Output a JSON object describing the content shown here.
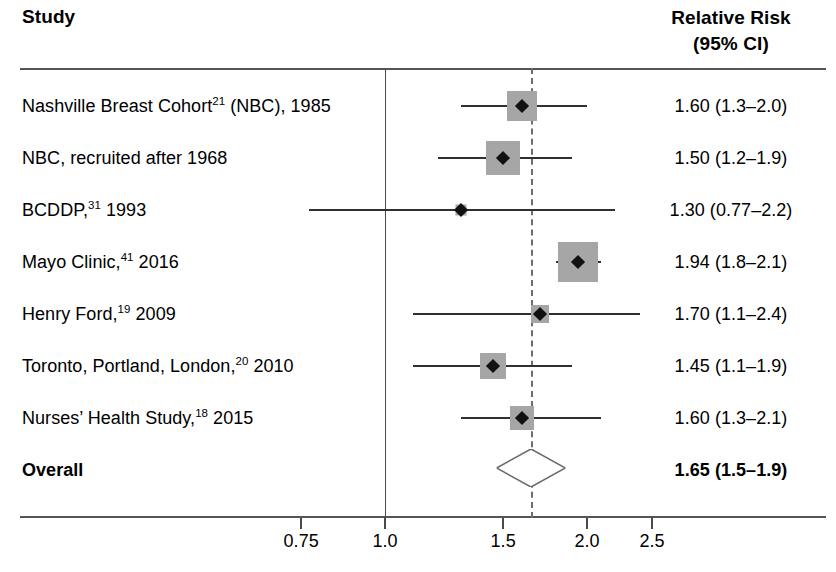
{
  "header": {
    "study_label": "Study",
    "rr_line1": "Relative Risk",
    "rr_line2": "(95% CI)"
  },
  "axis": {
    "tick_labels": [
      "0.75",
      "1.0",
      "1.5",
      "2.0",
      "2.5"
    ],
    "tick_values": [
      0.75,
      1.0,
      1.5,
      2.0,
      2.5
    ],
    "null_value": 1.0,
    "pooled_line_value": 1.65,
    "scale": "log"
  },
  "rows": [
    {
      "label_pre": "Nashville Breast Cohort",
      "ref": "21",
      "label_post": " (NBC), 1985",
      "value_text": "1.60 (1.3–2.0)",
      "rr": 1.6,
      "lo": 1.3,
      "hi": 2.0,
      "weight_box": 30,
      "bold": false
    },
    {
      "label_pre": "NBC, recruited after 1968",
      "ref": "",
      "label_post": "",
      "value_text": "1.50 (1.2–1.9)",
      "rr": 1.5,
      "lo": 1.2,
      "hi": 1.9,
      "weight_box": 34,
      "bold": false
    },
    {
      "label_pre": "BCDDP,",
      "ref": "31",
      "label_post": " 1993",
      "value_text": "1.30 (0.77–2.2)",
      "rr": 1.3,
      "lo": 0.77,
      "hi": 2.2,
      "weight_box": 11,
      "bold": false
    },
    {
      "label_pre": "Mayo Clinic,",
      "ref": "41",
      "label_post": " 2016",
      "value_text": "1.94 (1.8–2.1)",
      "rr": 1.94,
      "lo": 1.8,
      "hi": 2.1,
      "weight_box": 40,
      "bold": false
    },
    {
      "label_pre": "Henry Ford,",
      "ref": "19",
      "label_post": " 2009",
      "value_text": "1.70 (1.1–2.4)",
      "rr": 1.7,
      "lo": 1.1,
      "hi": 2.4,
      "weight_box": 18,
      "bold": false
    },
    {
      "label_pre": "Toronto, Portland, London,",
      "ref": "20",
      "label_post": " 2010",
      "value_text": "1.45 (1.1–1.9)",
      "rr": 1.45,
      "lo": 1.1,
      "hi": 1.9,
      "weight_box": 26,
      "bold": false
    },
    {
      "label_pre": "Nurses’ Health Study,",
      "ref": "18",
      "label_post": " 2015",
      "value_text": "1.60 (1.3–2.1)",
      "rr": 1.6,
      "lo": 1.3,
      "hi": 2.1,
      "weight_box": 24,
      "bold": false
    }
  ],
  "overall": {
    "label": "Overall",
    "value_text": "1.65 (1.5–1.9)",
    "rr": 1.65,
    "lo": 1.5,
    "hi": 1.9,
    "bold": true
  },
  "chart_data": {
    "type": "forest",
    "xlabel": "Relative Risk",
    "ylabel": "Study",
    "xscale": "log",
    "xlim": [
      0.7,
      2.7
    ],
    "xticks": [
      0.75,
      1.0,
      1.5,
      2.0,
      2.5
    ],
    "xticklabels": [
      "0.75",
      "1.0",
      "1.5",
      "2.0",
      "2.5"
    ],
    "reference_line": 1.0,
    "pooled_line": 1.65,
    "grid": false,
    "legend": "none",
    "categories": [
      "Nashville Breast Cohort21 (NBC), 1985",
      "NBC, recruited after 1968",
      "BCDDP,31 1993",
      "Mayo Clinic,41 2016",
      "Henry Ford,19 2009",
      "Toronto, Portland, London,20 2010",
      "Nurses’ Health Study,18 2015",
      "Overall"
    ],
    "estimates": [
      1.6,
      1.5,
      1.3,
      1.94,
      1.7,
      1.45,
      1.6,
      1.65
    ],
    "ci_lower": [
      1.3,
      1.2,
      0.77,
      1.8,
      1.1,
      1.1,
      1.3,
      1.5
    ],
    "ci_upper": [
      2.0,
      1.9,
      2.2,
      2.1,
      2.4,
      1.9,
      2.1,
      1.9
    ],
    "labels": [
      "1.60 (1.3–2.0)",
      "1.50 (1.2–1.9)",
      "1.30 (0.77–2.2)",
      "1.94 (1.8–2.1)",
      "1.70 (1.1–2.4)",
      "1.45 (1.1–1.9)",
      "1.60 (1.3–2.1)",
      "1.65 (1.5–1.9)"
    ]
  },
  "colors": {
    "box": "#a6a6a6",
    "point": "#111111",
    "line": "#303030",
    "rule": "#555555",
    "dashed": "#6d6d6d",
    "text": "#000000",
    "background": "#ffffff"
  }
}
